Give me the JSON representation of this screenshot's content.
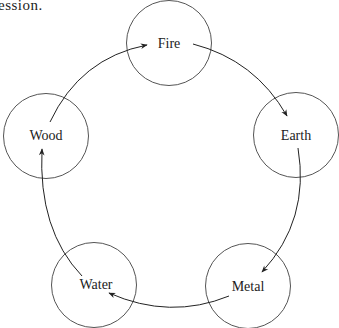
{
  "caption": "ession.",
  "diagram": {
    "type": "cycle",
    "nodes": [
      {
        "id": "fire",
        "label": "Fire",
        "cx": 169,
        "cy": 43
      },
      {
        "id": "earth",
        "label": "Earth",
        "cx": 296,
        "cy": 135
      },
      {
        "id": "metal",
        "label": "Metal",
        "cx": 248,
        "cy": 286
      },
      {
        "id": "water",
        "label": "Water",
        "cx": 94,
        "cy": 285
      },
      {
        "id": "wood",
        "label": "Wood",
        "cx": 46,
        "cy": 136
      }
    ],
    "edges": [
      {
        "from": "Wood",
        "to": "Fire"
      },
      {
        "from": "Fire",
        "to": "Earth"
      },
      {
        "from": "Earth",
        "to": "Metal"
      },
      {
        "from": "Metal",
        "to": "Water"
      },
      {
        "from": "Water",
        "to": "Wood"
      }
    ],
    "colors": {
      "stroke": "#555555",
      "text": "#222222",
      "arrow": "#222222"
    }
  }
}
